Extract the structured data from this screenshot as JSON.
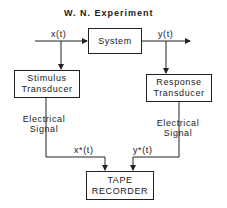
{
  "title": "W. N. Experiment",
  "blocks": {
    "system": {
      "label": "System"
    },
    "stimulus": {
      "line1": "Stimulus",
      "line2": "Transducer"
    },
    "response": {
      "line1": "Response",
      "line2": "Transducer"
    },
    "recorder": {
      "line1": "TAPE",
      "line2": "RECORDER"
    }
  },
  "signals": {
    "input": "x(t)",
    "output": "y(t)",
    "x_star": "x*(t)",
    "y_star": "y*(t)"
  },
  "annotations": {
    "left_electrical": {
      "line1": "Electrical",
      "line2": "Signal"
    },
    "right_electrical": {
      "line1": "Electrical",
      "line2": "Signal"
    }
  }
}
